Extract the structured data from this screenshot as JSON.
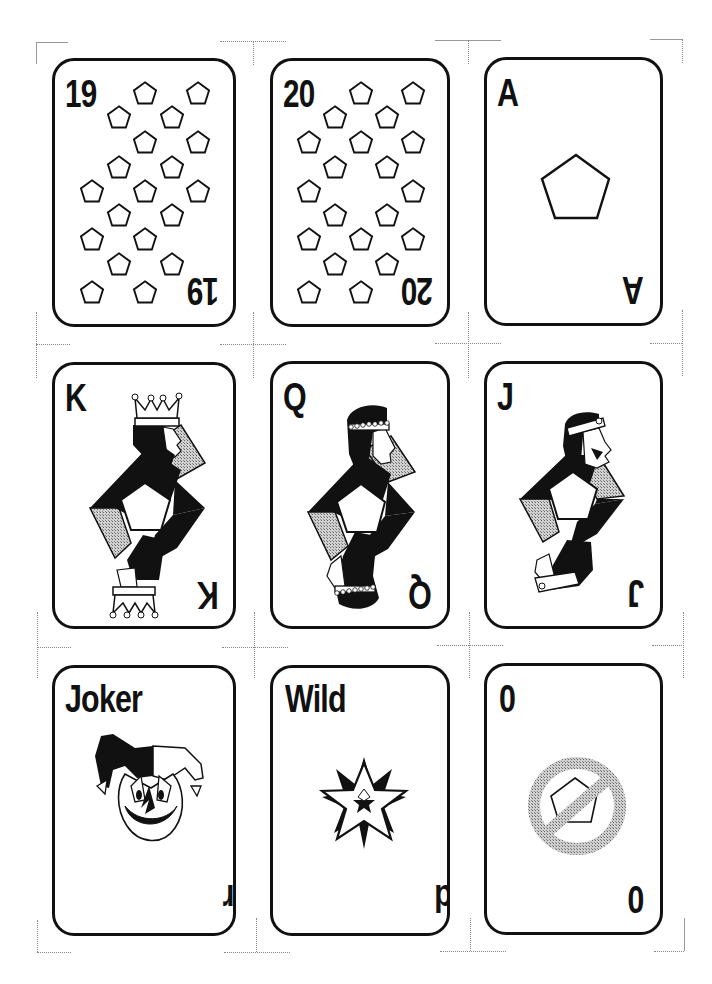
{
  "sheet": {
    "title": "Printable card sheet",
    "background": "#ffffff",
    "ink": "#111111",
    "shade": "#a8a8a8"
  },
  "cards": [
    {
      "name": "card-19",
      "rank": "19",
      "suit": "pentagon",
      "pip_count": 19,
      "row": 1,
      "col": 1
    },
    {
      "name": "card-20",
      "rank": "20",
      "suit": "pentagon",
      "pip_count": 20,
      "row": 1,
      "col": 2
    },
    {
      "name": "card-ace",
      "rank": "A",
      "suit": "pentagon",
      "pip_count": 1,
      "row": 1,
      "col": 3
    },
    {
      "name": "card-king",
      "rank": "K",
      "suit": "pentagon",
      "figure": "king",
      "row": 2,
      "col": 1
    },
    {
      "name": "card-queen",
      "rank": "Q",
      "suit": "pentagon",
      "figure": "queen",
      "row": 2,
      "col": 2
    },
    {
      "name": "card-jack",
      "rank": "J",
      "suit": "pentagon",
      "figure": "jack",
      "row": 2,
      "col": 3
    },
    {
      "name": "card-joker",
      "rank": "Joker",
      "figure": "jester-face-icon",
      "row": 3,
      "col": 1
    },
    {
      "name": "card-wild",
      "rank": "Wild",
      "figure": "star-burst-icon",
      "row": 3,
      "col": 2
    },
    {
      "name": "card-zero",
      "rank": "0",
      "figure": "no-pentagon-icon",
      "row": 3,
      "col": 3
    }
  ]
}
